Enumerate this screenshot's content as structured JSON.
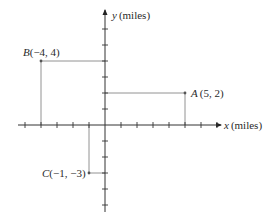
{
  "figure": {
    "x_axis_label": "x (miles)",
    "y_axis_label": "y (miles)",
    "x_var": "x",
    "y_var": "y",
    "unit": "(miles)",
    "colors": {
      "axis": "#333333",
      "guide": "#666666",
      "point": "#555555",
      "text": "#2a2a2a"
    }
  },
  "points": [
    {
      "name": "A",
      "coords": "(5, 2)",
      "x": 5,
      "y": 2
    },
    {
      "name": "B",
      "coords": "(−4, 4)",
      "x": -4,
      "y": 4
    },
    {
      "name": "C",
      "coords": "(−1, −3)",
      "x": -1,
      "y": -3
    }
  ],
  "axes": {
    "x_ticks": [
      -5,
      -4,
      -3,
      -2,
      -1,
      1,
      2,
      3,
      4,
      5,
      6,
      7
    ],
    "y_ticks": [
      -5,
      -4,
      -3,
      -2,
      -1,
      1,
      2,
      3,
      4,
      5,
      6
    ]
  }
}
